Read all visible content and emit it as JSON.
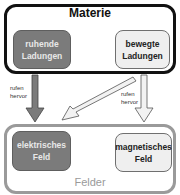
{
  "diagram": {
    "materie": {
      "title": "Materie",
      "left_box": {
        "line1": "ruhende",
        "line2": "Ladungen"
      },
      "right_box": {
        "line1": "bewegte",
        "line2": "Ladungen"
      }
    },
    "felder": {
      "title": "Felder",
      "left_box": {
        "line1": "elektrisches",
        "line2": "Feld"
      },
      "right_box": {
        "line1": "magnetisches",
        "line2": "Feld"
      }
    },
    "arrow_labels": {
      "left": {
        "line1": "rufen",
        "line2": "hervor"
      },
      "right": {
        "line1": "rufen",
        "line2": "hervor"
      }
    },
    "colors": {
      "dark_fill": "#7b7b7b",
      "light_fill": "#efefef",
      "materie_border": "#111111",
      "felder_border": "#9a9a9a"
    }
  }
}
